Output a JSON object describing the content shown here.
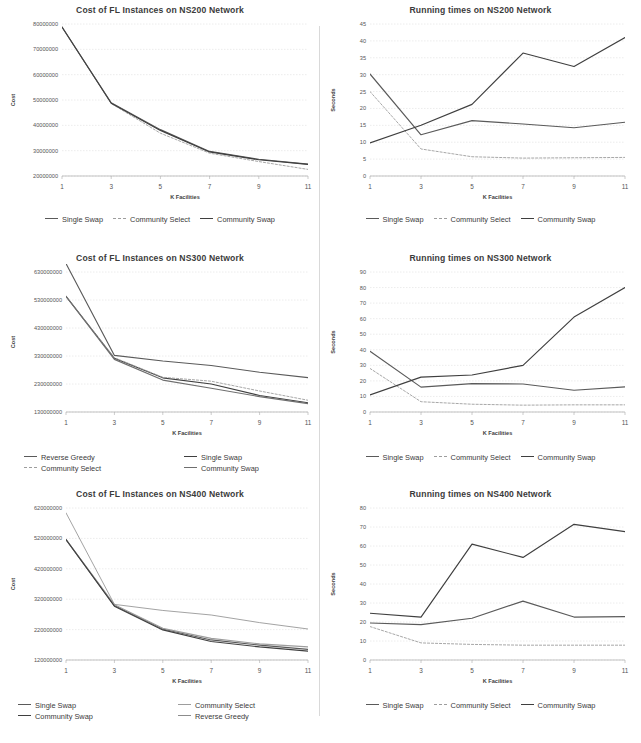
{
  "figure": {
    "rows": 3,
    "cols": 2,
    "background": "#ffffff",
    "axis_color": "#808080",
    "grid_color": "#d7d7d7"
  },
  "series_colors": {
    "single_swap": "#5a5a5a",
    "community_select": "#9d9d9d",
    "community_swap": "#3f3f3f",
    "reverse_greedy": "#8c8c8c"
  },
  "charts": [
    {
      "id": "cost-ns200",
      "chart_data": {
        "type": "line",
        "title": "Cost of FL Instances on NS200 Network",
        "xlabel": "K Facilities",
        "ylabel": "Cost",
        "x": [
          1,
          3,
          5,
          7,
          9,
          11
        ],
        "xticks": [
          "1",
          "3",
          "5",
          "7",
          "9",
          "11"
        ],
        "yticks": [
          "20000000",
          "30000000",
          "40000000",
          "50000000",
          "60000000",
          "70000000",
          "80000000"
        ],
        "ylim": [
          20000000,
          80000000
        ],
        "xlim": [
          1,
          11
        ],
        "grid": true,
        "legend_position": "bottom",
        "series": [
          {
            "name": "Single Swap",
            "style": "solid",
            "color": "#5a5a5a",
            "values": [
              78800000,
              48900000,
              38300000,
              29700000,
              26600000,
              24700000
            ]
          },
          {
            "name": "Community Select",
            "style": "dashed",
            "color": "#9d9d9d",
            "values": [
              78800000,
              48600000,
              36900000,
              29000000,
              25700000,
              22600000
            ]
          },
          {
            "name": "Community Swap",
            "style": "solid",
            "color": "#3f3f3f",
            "values": [
              78800000,
              48700000,
              38000000,
              29500000,
              26400000,
              24600000
            ]
          }
        ]
      }
    },
    {
      "id": "time-ns200",
      "chart_data": {
        "type": "line",
        "title": "Running times on NS200 Network",
        "xlabel": "K Facilities",
        "ylabel": "Seconds",
        "x": [
          1,
          3,
          5,
          7,
          9,
          11
        ],
        "xticks": [
          "1",
          "3",
          "5",
          "7",
          "9",
          "11"
        ],
        "yticks": [
          "0",
          "5",
          "10",
          "15",
          "20",
          "25",
          "30",
          "35",
          "40",
          "45"
        ],
        "ylim": [
          0,
          45
        ],
        "xlim": [
          1,
          11
        ],
        "grid": true,
        "legend_position": "bottom",
        "series": [
          {
            "name": "Single Swap",
            "style": "solid",
            "color": "#5a5a5a",
            "values": [
              30.2,
              12.2,
              16.4,
              15.4,
              14.3,
              15.9
            ]
          },
          {
            "name": "Community Select",
            "style": "dashed",
            "color": "#9d9d9d",
            "values": [
              25.0,
              8.0,
              5.7,
              5.3,
              5.4,
              5.5
            ]
          },
          {
            "name": "Community Swap",
            "style": "solid",
            "color": "#3f3f3f",
            "values": [
              9.8,
              15.0,
              21.2,
              36.4,
              32.4,
              41.0
            ]
          }
        ]
      }
    },
    {
      "id": "cost-ns300",
      "chart_data": {
        "type": "line",
        "title": "Cost of FL Instances on NS300 Network",
        "xlabel": "K Facilities",
        "ylabel": "Cost",
        "x": [
          1,
          3,
          5,
          7,
          9,
          11
        ],
        "xticks": [
          "1",
          "3",
          "5",
          "7",
          "9",
          "11"
        ],
        "yticks": [
          "130000000",
          "230000000",
          "330000000",
          "430000000",
          "530000000",
          "630000000"
        ],
        "ylim": [
          130000000,
          630000000
        ],
        "xlim": [
          1,
          11
        ],
        "grid": true,
        "legend_position": "bottom",
        "series": [
          {
            "name": "Reverse Greedy",
            "style": "solid",
            "color": "#5a5a5a",
            "values": [
              660000000,
              332000000,
              312000000,
              296000000,
              272000000,
              253000000
            ]
          },
          {
            "name": "Single Swap",
            "style": "solid",
            "color": "#3f3f3f",
            "values": [
              543000000,
              322000000,
              252000000,
              230000000,
              189000000,
              163000000
            ]
          },
          {
            "name": "Community Select",
            "style": "dashed",
            "color": "#9d9d9d",
            "values": [
              543000000,
              324000000,
              254000000,
              240000000,
              205000000,
              172000000
            ]
          },
          {
            "name": "Community Swap",
            "style": "solid",
            "color": "#6e6e6e",
            "values": [
              543000000,
              318000000,
              244000000,
              215000000,
              185000000,
              160000000
            ]
          }
        ]
      }
    },
    {
      "id": "time-ns300",
      "chart_data": {
        "type": "line",
        "title": "Running times on NS300 Network",
        "xlabel": "K Facilities",
        "ylabel": "Seconds",
        "x": [
          1,
          3,
          5,
          7,
          9,
          11
        ],
        "xticks": [
          "1",
          "3",
          "5",
          "7",
          "9",
          "11"
        ],
        "yticks": [
          "0",
          "10",
          "20",
          "30",
          "40",
          "50",
          "60",
          "70",
          "80",
          "90"
        ],
        "ylim": [
          0,
          90
        ],
        "xlim": [
          1,
          11
        ],
        "grid": true,
        "legend_position": "bottom",
        "series": [
          {
            "name": "Single Swap",
            "style": "solid",
            "color": "#5a5a5a",
            "values": [
              39.0,
              16.0,
              18.2,
              18.0,
              14.0,
              16.2
            ]
          },
          {
            "name": "Community Select",
            "style": "dashed",
            "color": "#9d9d9d",
            "values": [
              28.0,
              6.6,
              5.0,
              4.4,
              4.6,
              4.6
            ]
          },
          {
            "name": "Community Swap",
            "style": "solid",
            "color": "#3f3f3f",
            "values": [
              11.0,
              22.4,
              23.8,
              30.0,
              61.0,
              80.0
            ]
          }
        ]
      }
    },
    {
      "id": "cost-ns400",
      "chart_data": {
        "type": "line",
        "title": "Cost of FL Instances on NS400 Network",
        "xlabel": "K Facilities",
        "ylabel": "Cost",
        "x": [
          1,
          3,
          5,
          7,
          9,
          11
        ],
        "xticks": [
          "1",
          "3",
          "5",
          "7",
          "9",
          "11"
        ],
        "yticks": [
          "120000000",
          "220000000",
          "320000000",
          "420000000",
          "520000000",
          "620000000"
        ],
        "ylim": [
          120000000,
          620000000
        ],
        "xlim": [
          1,
          11
        ],
        "grid": true,
        "legend_position": "bottom",
        "series": [
          {
            "name": "Single Swap",
            "style": "solid",
            "color": "#5a5a5a",
            "values": [
              516000000,
              299000000,
              222000000,
              186000000,
              169000000,
              155000000
            ]
          },
          {
            "name": "Community Select",
            "style": "solid",
            "color": "#9d9d9d",
            "values": [
              516000000,
              302000000,
              224000000,
              191000000,
              173000000,
              163000000
            ]
          },
          {
            "name": "Community Swap",
            "style": "solid",
            "color": "#3f3f3f",
            "values": [
              516000000,
              297000000,
              219000000,
              181000000,
              163000000,
              149000000
            ]
          },
          {
            "name": "Reverse Greedy",
            "style": "thin",
            "color": "#8c8c8c",
            "values": [
              604000000,
              303000000,
              283000000,
              268000000,
              243000000,
              222000000
            ]
          }
        ]
      }
    },
    {
      "id": "time-ns400",
      "chart_data": {
        "type": "line",
        "title": "Running times on NS400 Network",
        "xlabel": "K Facilities",
        "ylabel": "Seconds",
        "x": [
          1,
          3,
          5,
          7,
          9,
          11
        ],
        "xticks": [
          "1",
          "3",
          "5",
          "7",
          "9",
          "11"
        ],
        "yticks": [
          "0",
          "10",
          "20",
          "30",
          "40",
          "50",
          "60",
          "70",
          "80"
        ],
        "ylim": [
          0,
          80
        ],
        "xlim": [
          1,
          11
        ],
        "grid": true,
        "legend_position": "bottom",
        "series": [
          {
            "name": "Single Swap",
            "style": "solid",
            "color": "#5a5a5a",
            "values": [
              19.5,
              18.6,
              22.0,
              31.0,
              22.6,
              22.8
            ]
          },
          {
            "name": "Community Select",
            "style": "dashed",
            "color": "#9d9d9d",
            "values": [
              17.6,
              9.0,
              8.2,
              7.8,
              7.8,
              7.8
            ]
          },
          {
            "name": "Community Swap",
            "style": "solid",
            "color": "#3f3f3f",
            "values": [
              24.6,
              22.6,
              61.0,
              54.0,
              71.4,
              67.6
            ]
          }
        ]
      }
    }
  ],
  "legends": {
    "cost-ns200": {
      "layout": "one-row",
      "items": [
        "Single Swap",
        "Community Select",
        "Community Swap"
      ]
    },
    "time-ns200": {
      "layout": "one-row",
      "items": [
        "Single Swap",
        "Community Select",
        "Community Swap"
      ]
    },
    "cost-ns300": {
      "layout": "two-col",
      "items": [
        "Reverse Greedy",
        "Single Swap",
        "Community Select",
        "Community Swap"
      ]
    },
    "time-ns300": {
      "layout": "one-row",
      "items": [
        "Single Swap",
        "Community Select",
        "Community Swap"
      ]
    },
    "cost-ns400": {
      "layout": "two-col",
      "items": [
        "Single Swap",
        "Community Select",
        "Community Swap",
        "Reverse Greedy"
      ]
    },
    "time-ns400": {
      "layout": "one-row",
      "items": [
        "Single Swap",
        "Community Select",
        "Community Swap"
      ]
    }
  }
}
